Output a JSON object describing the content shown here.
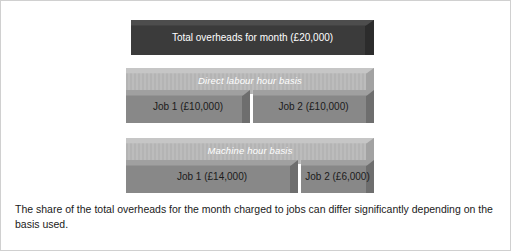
{
  "figure": {
    "border_color": "#d0d0d0",
    "background": "#ffffff"
  },
  "diagram": {
    "type": "isometric-block-allocation-diagram",
    "total": {
      "label": "Total overheads for month (£20,000)",
      "amount": 20000,
      "currency": "£",
      "color": "#3b3b3b",
      "text_color": "#ffffff"
    },
    "rows": [
      {
        "band_label": "Direct labour hour basis",
        "band_color": "#b8b8b8",
        "band_text_color": "#ffffff",
        "jobs": [
          {
            "label": "Job 1 (£10,000)",
            "name": "Job 1",
            "amount": 10000,
            "share_percent": 50,
            "color": "#888888"
          },
          {
            "label": "Job 2 (£10,000)",
            "name": "Job 2",
            "amount": 10000,
            "share_percent": 50,
            "color": "#888888"
          }
        ]
      },
      {
        "band_label": "Machine hour basis",
        "band_color": "#b8b8b8",
        "band_text_color": "#ffffff",
        "jobs": [
          {
            "label": "Job 1 (£14,000)",
            "name": "Job 1",
            "amount": 14000,
            "share_percent": 70,
            "color": "#888888"
          },
          {
            "label": "Job 2 (£6,000)",
            "name": "Job 2",
            "amount": 6000,
            "share_percent": 30,
            "color": "#888888"
          }
        ]
      }
    ]
  },
  "caption": {
    "text": "The share of the total overheads for the month charged to jobs can differ significantly depending on the basis used."
  }
}
